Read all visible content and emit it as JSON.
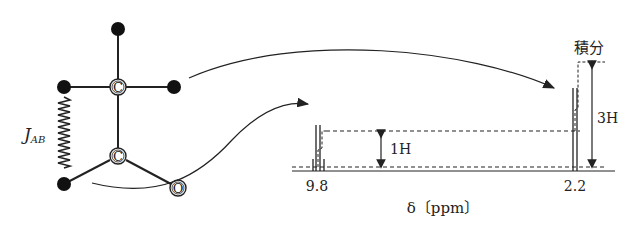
{
  "molecule": {
    "atoms": [
      {
        "id": "c1",
        "label": "C",
        "x": 118,
        "y": 87
      },
      {
        "id": "c2",
        "label": "C",
        "x": 118,
        "y": 156
      },
      {
        "id": "o",
        "label": "O",
        "x": 178,
        "y": 188
      }
    ],
    "hydrogens": [
      {
        "id": "h_top",
        "x": 118,
        "y": 29
      },
      {
        "id": "h_left",
        "x": 64,
        "y": 87
      },
      {
        "id": "h_right",
        "x": 174,
        "y": 87
      },
      {
        "id": "h_bottom",
        "x": 64,
        "y": 184
      }
    ],
    "coupling_label": "J",
    "coupling_subscript": "AB"
  },
  "spectrum": {
    "axis_label": "δ〔ppm〕",
    "peaks": [
      {
        "shift": "9.8",
        "integration": "1H",
        "multiplicity": "quartet"
      },
      {
        "shift": "2.2",
        "integration": "3H",
        "multiplicity": "doublet"
      }
    ],
    "integral_label": "積分"
  },
  "colors": {
    "ink": "#222222",
    "background": "#ffffff"
  }
}
